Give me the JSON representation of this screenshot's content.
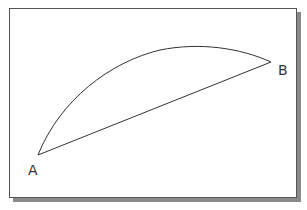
{
  "diagram": {
    "points": [
      {
        "id": "A",
        "label": "A",
        "x": 38,
        "y": 155
      },
      {
        "id": "B",
        "label": "B",
        "x": 271,
        "y": 62
      }
    ],
    "arc": {
      "from": "A",
      "to": "B",
      "control": [
        125,
        20
      ]
    },
    "chord": {
      "from": "A",
      "to": "B"
    },
    "colors": {
      "stroke": "#333333",
      "frame": "#555555",
      "shadow": "#8a8a8a",
      "background": "#ffffff"
    }
  },
  "labels": {
    "a": "A",
    "b": "B"
  }
}
